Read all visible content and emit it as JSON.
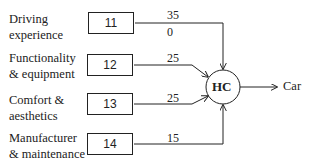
{
  "diagram": {
    "inputs": [
      {
        "label_line1": "Driving",
        "label_line2": "experience",
        "code": "11",
        "weight": "35",
        "weight_extra": "0"
      },
      {
        "label_line1": "Functionality",
        "label_line2": "& equipment",
        "code": "12",
        "weight": "25"
      },
      {
        "label_line1": "Comfort &",
        "label_line2": "aesthetics",
        "code": "13",
        "weight": "25"
      },
      {
        "label_line1": "Manufacturer",
        "label_line2": "& maintenance",
        "code": "14",
        "weight": "15"
      }
    ],
    "node": {
      "label": "HC"
    },
    "output": {
      "label": "Car"
    },
    "colors": {
      "stroke": "#222222",
      "background": "#ffffff"
    }
  }
}
